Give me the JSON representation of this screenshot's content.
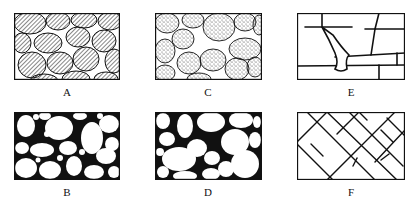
{
  "figure": {
    "panels": [
      {
        "id": "A",
        "label": "A",
        "fill": "hatched grains, tightly packed"
      },
      {
        "id": "B",
        "label": "B",
        "fill": "white grains, mixed sizes, dark pore space"
      },
      {
        "id": "C",
        "label": "C",
        "fill": "stippled grains, tightly packed"
      },
      {
        "id": "D",
        "label": "D",
        "fill": "white grains, well sorted, dark pore space"
      },
      {
        "id": "E",
        "label": "E",
        "fill": "blocky fractures with solution widening"
      },
      {
        "id": "F",
        "label": "F",
        "fill": "intersecting diagonal fractures"
      }
    ]
  },
  "colors": {
    "ink": "#111111",
    "paper": "#ffffff"
  }
}
